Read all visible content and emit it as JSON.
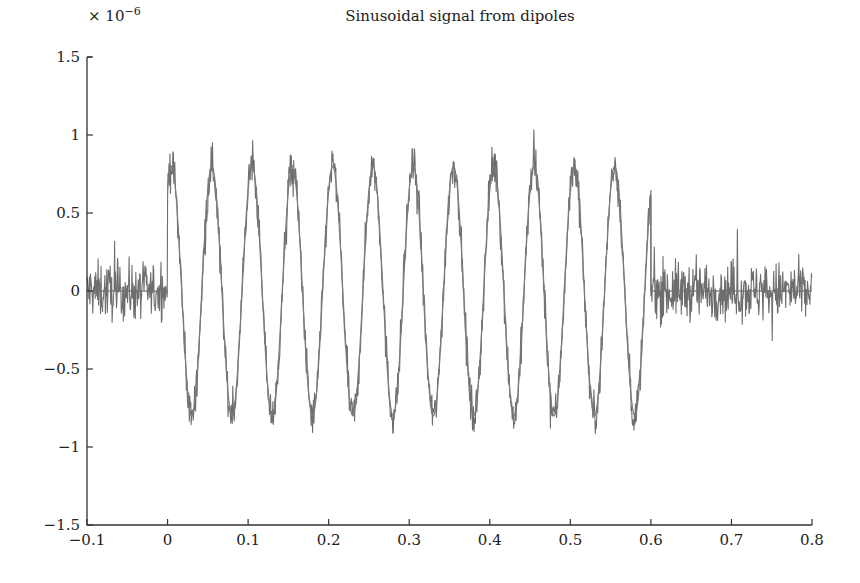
{
  "chart_data": {
    "type": "line",
    "title": "Sinusoidal signal from dipoles",
    "xlabel": "",
    "ylabel": "",
    "y_multiplier": "× 10",
    "y_multiplier_exp": "−6",
    "xlim": [
      -0.1,
      0.8
    ],
    "ylim": [
      -1.5,
      1.5
    ],
    "x_ticks": [
      -0.1,
      0,
      0.1,
      0.2,
      0.3,
      0.4,
      0.5,
      0.6,
      0.7,
      0.8
    ],
    "x_tick_labels": [
      "−0.1",
      "0",
      "0.1",
      "0.2",
      "0.3",
      "0.4",
      "0.5",
      "0.6",
      "0.7",
      "0.8"
    ],
    "y_ticks": [
      -1.5,
      -1,
      -0.5,
      0,
      0.5,
      1,
      1.5
    ],
    "y_tick_labels": [
      "−1.5",
      "−1",
      "−0.5",
      "0",
      "0.5",
      "1",
      "1.5"
    ],
    "grid": false,
    "legend": null,
    "series": [
      {
        "name": "noisy signal",
        "color": "#6e6e6e",
        "description": "Noise-only segment for t in [-0.1, 0) and (0.6, 0.8] (amplitude ~±0.3, spikes up to ~0.5); sinusoid of amplitude ~0.8 at ~20 Hz (12 cycles) between t=0 and t=0.6 with added noise",
        "segments": [
          {
            "t_start": -0.1,
            "t_end": 0.0,
            "kind": "noise",
            "noise_std": 0.13
          },
          {
            "t_start": 0.0,
            "t_end": 0.6,
            "kind": "sinusoid",
            "amplitude": 0.8,
            "frequency_hz": 20,
            "phase_peak_t": 0.005,
            "noise_std": 0.09
          },
          {
            "t_start": 0.6,
            "t_end": 0.8,
            "kind": "noise",
            "noise_std": 0.13
          }
        ],
        "peaks_x": [
          0.005,
          0.055,
          0.103,
          0.153,
          0.203,
          0.254,
          0.302,
          0.352,
          0.401,
          0.451,
          0.5,
          0.551
        ],
        "peaks_y_approx": [
          0.97,
          1.15,
          1.0,
          0.8,
          0.85,
          1.05,
          0.9,
          1.02,
          0.82,
          1.0,
          1.08,
          0.8
        ],
        "troughs_x": [
          0.027,
          0.078,
          0.128,
          0.178,
          0.228,
          0.278,
          0.327,
          0.376,
          0.426,
          0.476,
          0.525,
          0.575
        ],
        "troughs_y_approx": [
          -0.95,
          -0.85,
          -0.92,
          -1.07,
          -0.92,
          -1.0,
          -0.92,
          -1.1,
          -1.08,
          -0.97,
          -0.9,
          -0.97
        ]
      },
      {
        "name": "zero baseline",
        "color": "#555555",
        "description": "Flat line at y=0 drawn over the noise-only segments",
        "segments": [
          {
            "t_start": -0.1,
            "t_end": 0.0,
            "value": 0
          },
          {
            "t_start": 0.6,
            "t_end": 0.8,
            "value": 0
          }
        ]
      }
    ]
  }
}
